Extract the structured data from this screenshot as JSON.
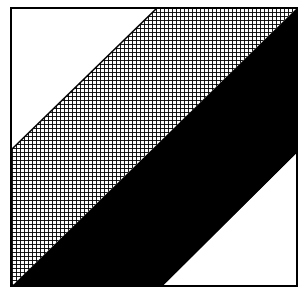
{
  "figure": {
    "colors": {
      "background": "#ffffff",
      "ink": "#000000"
    },
    "frame": {
      "x": 11,
      "y": 8,
      "width": 286,
      "height": 278,
      "stroke_width": 2
    },
    "hatch": {
      "spacing": 4,
      "stroke_width": 0.9
    },
    "regions": [
      {
        "name": "top-left-white-triangle",
        "fill": "white",
        "points": "11,8 157,8 11,150"
      },
      {
        "name": "crosshatched-band",
        "fill": "hatch",
        "points": "157,8 297,8 12,286 11,286 11,150"
      },
      {
        "name": "black-band",
        "fill": "black",
        "points": "297,8 297,153 163,286 12,286"
      },
      {
        "name": "bottom-right-white-triangle",
        "fill": "white",
        "points": "297,153 297,286 163,286"
      }
    ],
    "lines": [
      {
        "name": "upper-diagonal",
        "x1": 11,
        "y1": 150,
        "x2": 157,
        "y2": 8
      }
    ]
  }
}
